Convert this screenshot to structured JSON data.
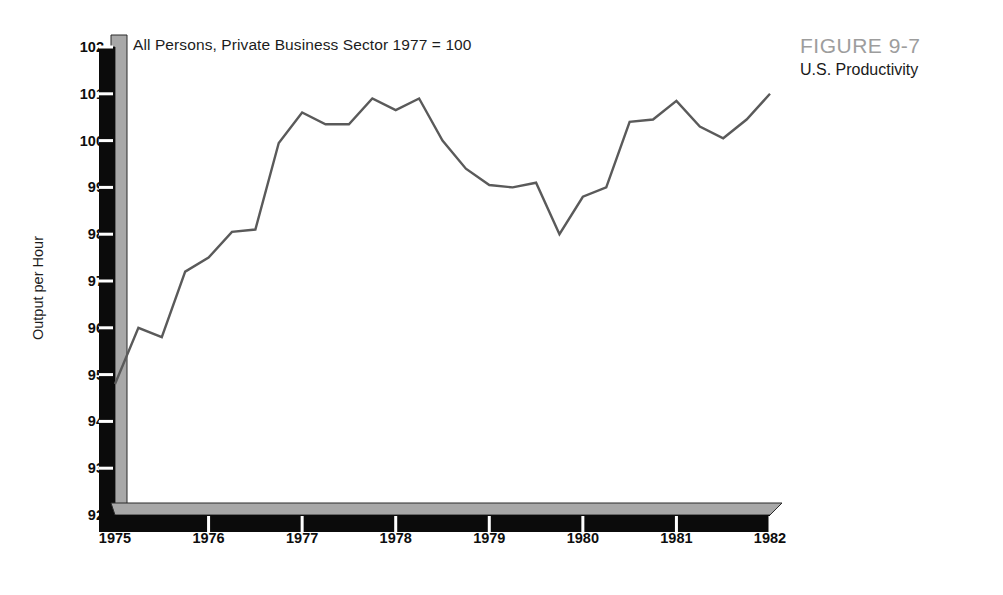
{
  "figure": {
    "number_label": "FIGURE 9-7",
    "caption_title": "U.S. Productivity"
  },
  "chart_data": {
    "type": "line",
    "title": "All Persons, Private Business Sector 1977 = 100",
    "xlabel": "",
    "ylabel": "Output per Hour",
    "xlim": [
      1975,
      1982
    ],
    "ylim": [
      92,
      102
    ],
    "grid": false,
    "legend": null,
    "x_tick_labels": [
      "1975",
      "1976",
      "1977",
      "1978",
      "1979",
      "1980",
      "1981",
      "1982"
    ],
    "x_ticks": [
      1975,
      1976,
      1977,
      1978,
      1979,
      1980,
      1981,
      1982
    ],
    "y_tick_labels": [
      "92",
      "93",
      "94",
      "95",
      "96",
      "97",
      "98",
      "99",
      "100",
      "101",
      "102"
    ],
    "y_ticks": [
      92,
      93,
      94,
      95,
      96,
      97,
      98,
      99,
      100,
      101,
      102
    ],
    "series": [
      {
        "name": "Output per Hour",
        "color": "#5a5a5a",
        "x": [
          1975.0,
          1975.25,
          1975.5,
          1975.75,
          1976.0,
          1976.25,
          1976.5,
          1976.75,
          1977.0,
          1977.25,
          1977.5,
          1977.75,
          1978.0,
          1978.25,
          1978.5,
          1978.75,
          1979.0,
          1979.25,
          1979.5,
          1979.75,
          1980.0,
          1980.25,
          1980.5,
          1980.75,
          1981.0,
          1981.25,
          1981.5,
          1981.75,
          1982.0
        ],
        "y": [
          94.8,
          96.0,
          95.8,
          97.2,
          97.5,
          98.05,
          98.1,
          99.95,
          100.6,
          100.35,
          100.35,
          100.9,
          100.65,
          100.9,
          100.0,
          99.4,
          99.05,
          99.0,
          99.1,
          98.0,
          98.8,
          99.0,
          100.4,
          100.45,
          100.85,
          100.3,
          100.05,
          100.45,
          101.0
        ]
      }
    ]
  },
  "axis_style": {
    "front_face_color": "#0b0b0b",
    "top_face_color": "#a8a8a8",
    "line_color": "#5a5a5a"
  }
}
